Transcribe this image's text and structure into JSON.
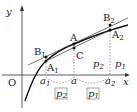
{
  "axes": {
    "x_label": "x",
    "y_label": "y",
    "origin_label": "O"
  },
  "points": {
    "A": "A",
    "A1": "A",
    "A1_sub": "1",
    "A2": "A",
    "A2_sub": "2",
    "B1": "B",
    "B1_sub": "1",
    "B2": "B",
    "B2_sub": "2",
    "C": "C"
  },
  "x_ticks": {
    "a1": "a",
    "a1_sub": "1",
    "a": "a",
    "a2": "a",
    "a2_sub": "2"
  },
  "ratios": {
    "p2_inner": "p",
    "p2_inner_sub": "2",
    "p1_inner": "p",
    "p1_inner_sub": "1",
    "p2_box": "p",
    "p2_box_sub": "2",
    "p1_box": "p",
    "p1_box_sub": "1"
  }
}
